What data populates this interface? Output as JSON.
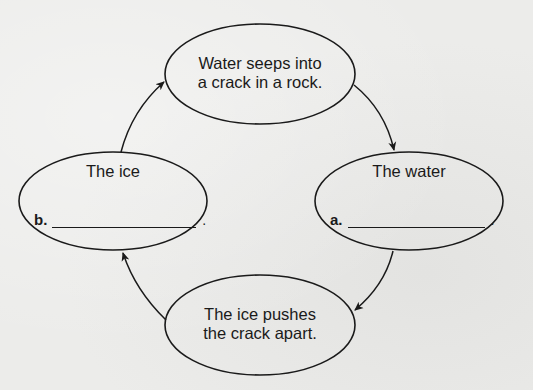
{
  "diagram": {
    "type": "cycle",
    "nodes": [
      {
        "id": "top",
        "lines": [
          "Water seeps into",
          "a crack in a rock."
        ]
      },
      {
        "id": "right",
        "label": "The water",
        "blank_letter": "a.",
        "blank_suffix": "."
      },
      {
        "id": "bottom",
        "lines": [
          "The ice pushes",
          "the crack apart."
        ]
      },
      {
        "id": "left",
        "label": "The ice",
        "blank_letter": "b.",
        "blank_suffix": "."
      }
    ],
    "edges": [
      {
        "from": "top",
        "to": "right"
      },
      {
        "from": "right",
        "to": "bottom"
      },
      {
        "from": "bottom",
        "to": "left"
      },
      {
        "from": "left",
        "to": "top"
      }
    ],
    "stroke_color": "#1a1a1a"
  }
}
